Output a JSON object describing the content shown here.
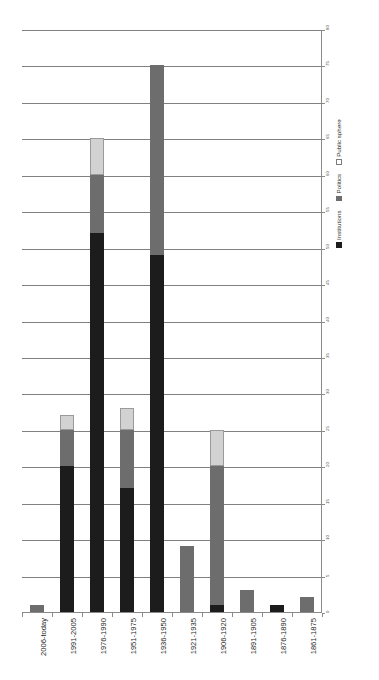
{
  "chart_data": {
    "type": "bar",
    "title": "",
    "subtitle": "",
    "xlabel": "",
    "ylabel": "",
    "stacked": true,
    "orientation": "vertical",
    "grid": true,
    "legend_position": "right-rotated",
    "ylim": [
      0,
      80
    ],
    "ytick_step": 5,
    "ytick_labels": [
      "0",
      "5",
      "10",
      "15",
      "20",
      "25",
      "30",
      "35",
      "40",
      "45",
      "50",
      "55",
      "60",
      "65",
      "70",
      "75",
      "80"
    ],
    "categories": [
      "2006-today",
      "1991-2005",
      "1976-1990",
      "1951-1975",
      "1936-1950",
      "1921-1935",
      "1906-1920",
      "1891-1905",
      "1876-1890",
      "1861-1875"
    ],
    "series": [
      {
        "name": "Institutions",
        "color": "#1c1c1c",
        "values": [
          0,
          20,
          52,
          17,
          49,
          0,
          1,
          0,
          1,
          0
        ]
      },
      {
        "name": "Politics",
        "color": "#6d6d6d",
        "values": [
          1,
          5,
          8,
          8,
          26,
          9,
          19,
          3,
          0,
          2
        ]
      },
      {
        "name": "Public sphere",
        "color": "#d2d2d2",
        "values": [
          0,
          2,
          5,
          3,
          0,
          0,
          5,
          0,
          0,
          0
        ]
      }
    ],
    "totals": [
      1,
      27,
      65,
      28,
      75,
      9,
      25,
      3,
      1,
      2
    ]
  },
  "legend": {
    "items": [
      {
        "label": "Institutions",
        "swatch": "institutions"
      },
      {
        "label": "Politics",
        "swatch": "politics"
      },
      {
        "label": "Public sphere",
        "swatch": "publicsphere"
      }
    ]
  },
  "colors": {
    "institutions": "#1c1c1c",
    "politics": "#6d6d6d",
    "public_sphere": "#d2d2d2",
    "gridline": "#808080",
    "axis": "#8a8a8a",
    "text": "#2a2a2a",
    "background": "#ffffff"
  }
}
